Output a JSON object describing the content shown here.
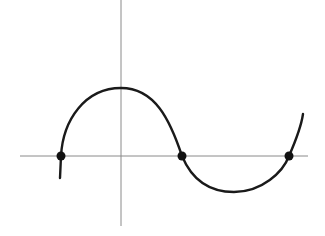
{
  "diagram": {
    "type": "function-graph",
    "colors": {
      "background": "#ffffff",
      "axis": "#888888",
      "curve": "#1a1a1a",
      "point": "#111111"
    },
    "axes": {
      "x_axis": {
        "x1": 20,
        "x2": 308,
        "y": 156
      },
      "y_axis": {
        "x": 121,
        "y1": 0,
        "y2": 226
      }
    },
    "curve": {
      "start": [
        60,
        178
      ],
      "local_max": [
        121,
        88
      ],
      "local_min": [
        234,
        192
      ],
      "end": [
        303,
        114
      ]
    },
    "roots": [
      {
        "x": 61,
        "y": 156
      },
      {
        "x": 182,
        "y": 156
      },
      {
        "x": 289,
        "y": 156
      }
    ]
  }
}
